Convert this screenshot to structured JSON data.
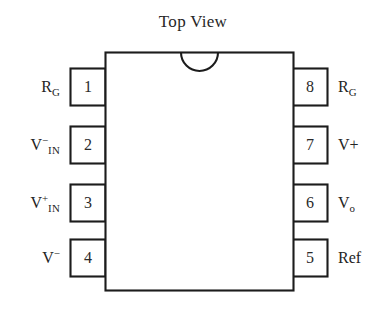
{
  "diagram": {
    "title": "Top View",
    "package": "8-pin DIP",
    "colors": {
      "background": "#ffffff",
      "outline": "#1c1c1c",
      "text": "#242424"
    },
    "notch": {
      "shape": "semicircle",
      "position": "top-center"
    },
    "pins": {
      "left": [
        {
          "number": "1",
          "label_main": "R",
          "label_sup": "",
          "label_sub": "G",
          "label_plain": "RG"
        },
        {
          "number": "2",
          "label_main": "V",
          "label_sup": "−",
          "label_sub": "IN",
          "label_plain": "V−IN"
        },
        {
          "number": "3",
          "label_main": "V",
          "label_sup": "+",
          "label_sub": "IN",
          "label_plain": "V+IN"
        },
        {
          "number": "4",
          "label_main": "V",
          "label_sup": "−",
          "label_sub": "",
          "label_plain": "V−"
        }
      ],
      "right": [
        {
          "number": "8",
          "label_main": "R",
          "label_sup": "",
          "label_sub": "G",
          "label_plain": "RG"
        },
        {
          "number": "7",
          "label_main": "V+",
          "label_sup": "",
          "label_sub": "",
          "label_plain": "V+"
        },
        {
          "number": "6",
          "label_main": "V",
          "label_sup": "",
          "label_sub": "o",
          "label_plain": "Vo"
        },
        {
          "number": "5",
          "label_main": "Ref",
          "label_sup": "",
          "label_sub": "",
          "label_plain": "Ref"
        }
      ]
    }
  }
}
